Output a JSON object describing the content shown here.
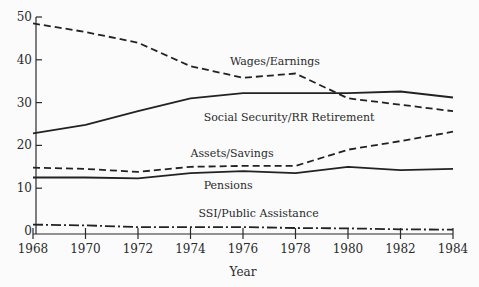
{
  "chart_data": {
    "type": "line",
    "title": "",
    "xlabel": "Year",
    "ylabel": "",
    "x": [
      1968,
      1970,
      1972,
      1974,
      1976,
      1978,
      1980,
      1982,
      1984
    ],
    "xlim": [
      1968,
      1984
    ],
    "ylim": [
      0,
      50
    ],
    "yticks": [
      0,
      10,
      20,
      30,
      40,
      50
    ],
    "xticks": [
      1968,
      1970,
      1972,
      1974,
      1976,
      1978,
      1980,
      1982,
      1984
    ],
    "grid": false,
    "legend": "inline labels",
    "series": [
      {
        "name": "Wages/Earnings",
        "style": "dashed",
        "values": [
          48.5,
          46.5,
          44.0,
          38.5,
          35.8,
          36.8,
          31.0,
          29.5,
          28.0
        ],
        "label_pos": [
          1975.5,
          38.8
        ]
      },
      {
        "name": "Social Security/RR Retirement",
        "style": "solid",
        "values": [
          22.8,
          24.8,
          28.0,
          31.0,
          32.2,
          32.2,
          32.2,
          32.6,
          31.2
        ],
        "label_pos": [
          1974.5,
          25.7
        ]
      },
      {
        "name": "Assets/Savings",
        "style": "dashed",
        "values": [
          14.8,
          14.5,
          13.8,
          15.0,
          15.2,
          15.2,
          19.0,
          21.0,
          23.2
        ],
        "label_pos": [
          1974.0,
          17.3
        ]
      },
      {
        "name": "Pensions",
        "style": "solid",
        "values": [
          12.5,
          12.5,
          12.3,
          13.5,
          14.0,
          13.5,
          15.0,
          14.2,
          14.5
        ],
        "label_pos": [
          1974.5,
          9.8
        ]
      },
      {
        "name": "SSI/Public Assistance",
        "style": "dashdot",
        "values": [
          1.5,
          1.3,
          0.9,
          0.9,
          0.9,
          0.7,
          0.6,
          0.4,
          0.3
        ],
        "label_pos": [
          1974.3,
          3.3
        ]
      }
    ]
  }
}
